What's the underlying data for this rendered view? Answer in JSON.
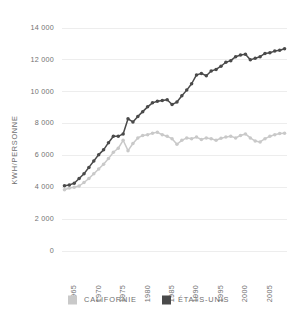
{
  "chart_data": {
    "type": "line",
    "title": "",
    "xlabel": "",
    "ylabel": "KWH/PERSONNE",
    "xlim": [
      1962.5,
      2008.5
    ],
    "ylim": [
      0,
      14000
    ],
    "grid": true,
    "grid_axis": "y",
    "legend_position": "bottom",
    "ytick_labels": [
      "0",
      "2 000",
      "4 000",
      "6 000",
      "8 000",
      "10 000",
      "12 000",
      "14 000"
    ],
    "ytick_values": [
      0,
      2000,
      4000,
      6000,
      8000,
      10000,
      12000,
      14000
    ],
    "xtick_labels": [
      "1965",
      "1970",
      "1975",
      "1980",
      "1985",
      "1990",
      "1995",
      "2000",
      "2005"
    ],
    "xtick_values": [
      1965,
      1970,
      1975,
      1980,
      1985,
      1990,
      1995,
      2000,
      2005
    ],
    "x": [
      1963,
      1964,
      1965,
      1966,
      1967,
      1968,
      1969,
      1970,
      1971,
      1972,
      1973,
      1974,
      1975,
      1976,
      1977,
      1978,
      1979,
      1980,
      1981,
      1982,
      1983,
      1984,
      1985,
      1986,
      1987,
      1988,
      1989,
      1990,
      1991,
      1992,
      1993,
      1994,
      1995,
      1996,
      1997,
      1998,
      1999,
      2000,
      2001,
      2002,
      2003,
      2004,
      2005,
      2006,
      2007,
      2008
    ],
    "series": [
      {
        "name": "CALIFORNIE",
        "color": "#c9c9c9",
        "marker": "circle",
        "values": [
          3850,
          3950,
          4000,
          4080,
          4300,
          4550,
          4850,
          5150,
          5450,
          5800,
          6200,
          6450,
          6950,
          6300,
          6750,
          7100,
          7250,
          7300,
          7400,
          7450,
          7300,
          7200,
          7050,
          6700,
          6950,
          7100,
          7050,
          7150,
          7000,
          7100,
          7050,
          6950,
          7080,
          7150,
          7200,
          7100,
          7250,
          7350,
          7100,
          6900,
          6850,
          7050,
          7200,
          7300,
          7380,
          7400
        ]
      },
      {
        "name": "ÉTATS-UNIS",
        "color": "#4a4a4a",
        "marker": "circle",
        "values": [
          4100,
          4150,
          4250,
          4550,
          4850,
          5250,
          5650,
          6050,
          6350,
          6800,
          7200,
          7200,
          7350,
          8300,
          8100,
          8450,
          8750,
          9050,
          9300,
          9400,
          9450,
          9500,
          9200,
          9350,
          9750,
          10100,
          10500,
          11050,
          11150,
          11000,
          11300,
          11400,
          11600,
          11850,
          11950,
          12200,
          12300,
          12350,
          12000,
          12100,
          12200,
          12400,
          12450,
          12550,
          12600,
          12700
        ]
      }
    ]
  },
  "legend": {
    "items": [
      {
        "label": "CALIFORNIE",
        "color": "#c9c9c9"
      },
      {
        "label": "ÉTATS-UNIS",
        "color": "#4a4a4a"
      }
    ]
  }
}
